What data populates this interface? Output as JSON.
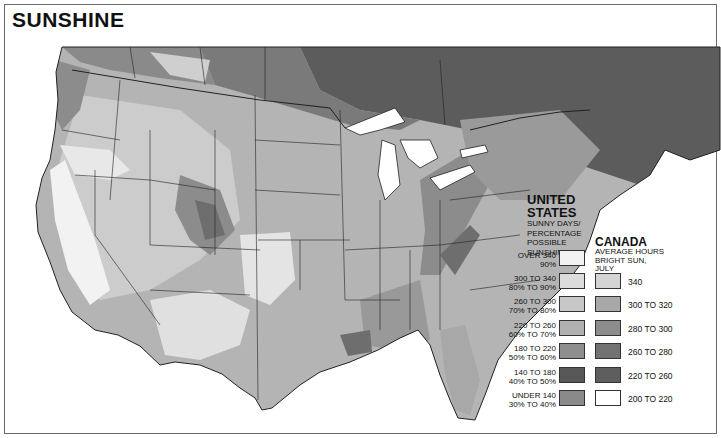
{
  "title": "SUNSHINE",
  "legend": {
    "united_states": {
      "heading_line1": "UNITED",
      "heading_line2": "STATES",
      "subheading": [
        "SUNNY DAYS/",
        "PERCENTAGE",
        "POSSIBLE",
        "SUNSHINE"
      ],
      "items": [
        {
          "days": "OVER 340",
          "percent": "90%",
          "color": "#f2f2f2"
        },
        {
          "days": "300 TO 340",
          "percent": "80% TO 90%",
          "color": "#dcdcdc"
        },
        {
          "days": "260 TO 300",
          "percent": "70% TO 80%",
          "color": "#c8c8c8"
        },
        {
          "days": "220 TO 260",
          "percent": "60% TO 70%",
          "color": "#b0b0b0"
        },
        {
          "days": "180 TO 220",
          "percent": "50% TO 60%",
          "color": "#8e8e8e"
        },
        {
          "days": "140 TO 180",
          "percent": "40% TO 50%",
          "color": "#575757"
        },
        {
          "days": "UNDER 140",
          "percent": "30% TO 40%",
          "color": "#8a8a8a"
        }
      ]
    },
    "canada": {
      "heading": "CANADA",
      "subheading": [
        "AVERAGE HOURS",
        "BRIGHT SUN,",
        "JULY"
      ],
      "items": [
        {
          "hours": "340",
          "color": "#d4d4d4"
        },
        {
          "hours": "300 TO 320",
          "color": "#a8a8a8"
        },
        {
          "hours": "280 TO 300",
          "color": "#8c8c8c"
        },
        {
          "hours": "260 TO 280",
          "color": "#727272"
        },
        {
          "hours": "220 TO 260",
          "color": "#5e5e5e"
        },
        {
          "hours": "200 TO 220",
          "color": "#ffffff"
        }
      ]
    }
  },
  "map_colors": {
    "water": "#ffffff",
    "canada_north": "#5c5c5c",
    "canada_mid": "#7a7a7a",
    "canada_west": "#8a8a8a",
    "us_base": "#b4b4b4",
    "us_light": "#d6d6d6",
    "us_lighter": "#e6e6e6",
    "us_lightest": "#f4f4f4",
    "us_dark": "#8c8c8c",
    "us_darker": "#6e6e6e",
    "border": "#222222"
  }
}
